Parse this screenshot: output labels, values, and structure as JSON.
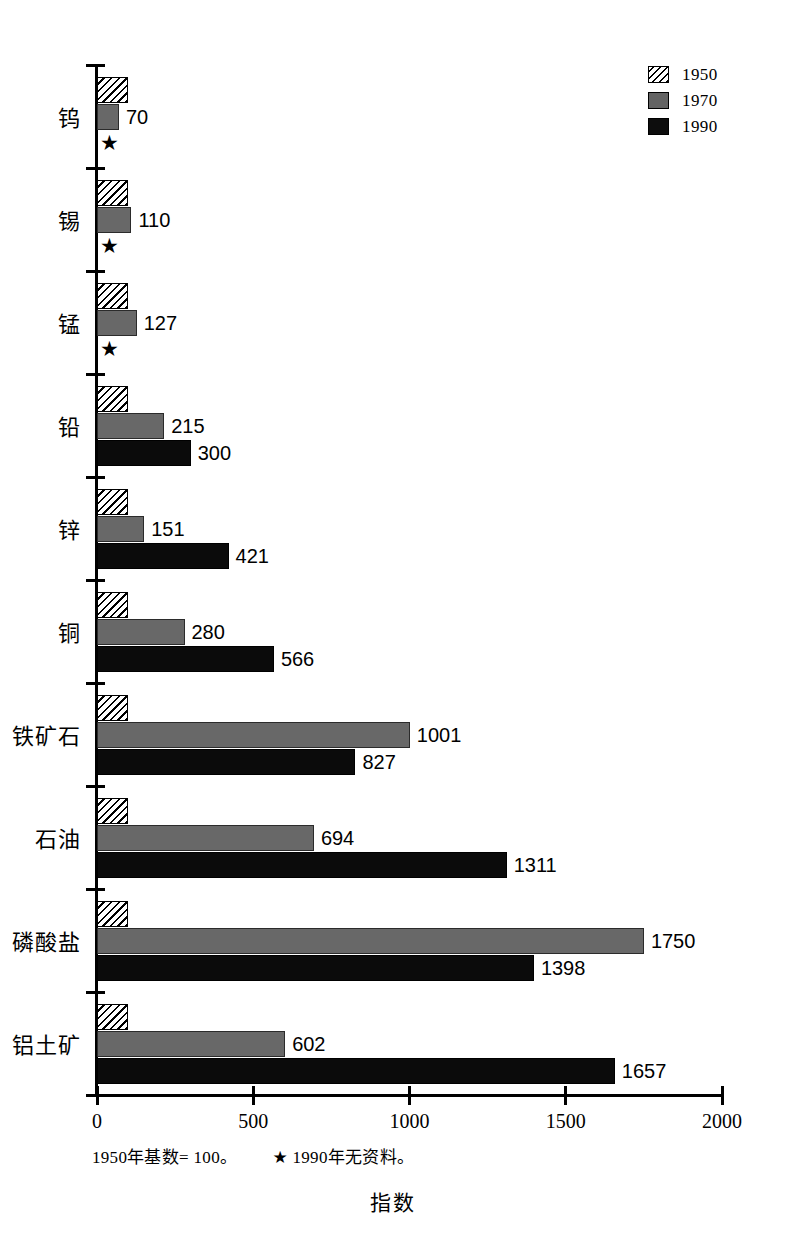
{
  "chart_data": {
    "type": "bar",
    "orientation": "horizontal",
    "title": "",
    "xlabel": "指数",
    "ylabel": "",
    "xlim": [
      0,
      2000
    ],
    "xticks": [
      "0",
      "500",
      "1000",
      "1500",
      "2000"
    ],
    "grid": false,
    "legend_position": "top-right",
    "categories": [
      "钨",
      "锡",
      "锰",
      "铅",
      "锌",
      "铜",
      "铁矿石",
      "石油",
      "磷酸盐",
      "铝土矿"
    ],
    "series": [
      {
        "name": "1950",
        "color": "#ffffff",
        "pattern": "diagonal-hatch",
        "values": [
          100,
          100,
          100,
          100,
          100,
          100,
          100,
          100,
          100,
          100
        ],
        "labels": [
          "",
          "",
          "",
          "",
          "",
          "",
          "",
          "",
          "",
          ""
        ]
      },
      {
        "name": "1970",
        "color": "#686868",
        "pattern": "solid-gray",
        "values": [
          70,
          110,
          127,
          215,
          151,
          280,
          1001,
          694,
          1750,
          602
        ],
        "labels": [
          "70",
          "110",
          "127",
          "215",
          "151",
          "280",
          "1001",
          "694",
          "1750",
          "602"
        ]
      },
      {
        "name": "1990",
        "color": "#0b0b0b",
        "pattern": "solid-black",
        "values": [
          null,
          null,
          null,
          300,
          421,
          566,
          827,
          1311,
          1398,
          1657
        ],
        "labels": [
          "★",
          "★",
          "★",
          "300",
          "421",
          "566",
          "827",
          "1311",
          "1398",
          "1657"
        ]
      }
    ],
    "no_data_marker": "★",
    "footnote": "1950年基数= 100。",
    "footnote_note": "1990年无资料。",
    "footnote_star": "★"
  },
  "legend": {
    "items": [
      {
        "label": "1950",
        "swatch": "hatched-swatch"
      },
      {
        "label": "1970",
        "swatch": "gray-swatch"
      },
      {
        "label": "1990",
        "swatch": "black-swatch"
      }
    ]
  },
  "axis": {
    "x_title": "指数",
    "ticks": [
      "0",
      "500",
      "1000",
      "1500",
      "2000"
    ]
  },
  "footnote": {
    "base_text": "1950年基数= 100。",
    "star": "★",
    "note_text": "1990年无资料。"
  }
}
